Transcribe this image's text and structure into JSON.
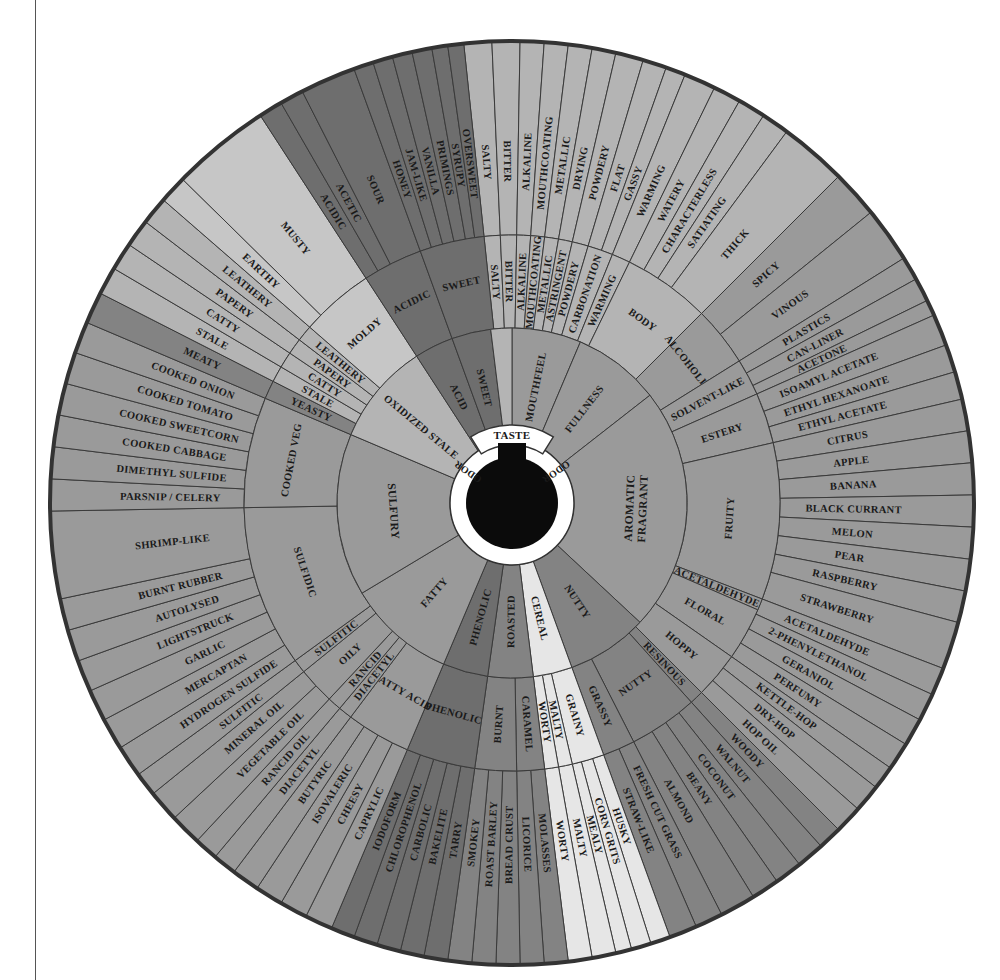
{
  "page": {
    "top_cropped_text": "",
    "background": "#ffffff"
  },
  "wheel": {
    "center": [
      512,
      503
    ],
    "radii": {
      "hub": 46,
      "hub_ring": 62,
      "inner": 175,
      "middle": 268,
      "outer": 462
    },
    "colors": {
      "dark": "#6e6e6e",
      "mid_dark": "#838383",
      "mid": "#9a9a9a",
      "light": "#b4b4b4",
      "lighter": "#c6c6c6",
      "pale": "#e6e6e6",
      "hub": "#0b0b0b",
      "hub_ring": "#ffffff",
      "rim": "#333333"
    },
    "hub_labels": {
      "taste": "TASTE",
      "odor_left": "ODOR",
      "odor_right": "ODOR"
    },
    "inner": [
      {
        "label": "MOUTHFEEL",
        "start": 0,
        "end": 23,
        "color": "mid"
      },
      {
        "label": "FULLNESS",
        "start": 23,
        "end": 52,
        "color": "mid"
      },
      {
        "label": "AROMATIC FRAGRANT",
        "start": 52,
        "end": 133,
        "color": "mid"
      },
      {
        "label": "NUTTY",
        "start": 133,
        "end": 160,
        "color": "mid_dark"
      },
      {
        "label": "CEREAL",
        "start": 160,
        "end": 173,
        "color": "pale"
      },
      {
        "label": "ROASTED",
        "start": 173,
        "end": 188,
        "color": "mid_dark"
      },
      {
        "label": "PHENOLIC",
        "start": 188,
        "end": 203,
        "color": "dark"
      },
      {
        "label": "FATTY",
        "start": 203,
        "end": 239,
        "color": "mid"
      },
      {
        "label": "SULFURY",
        "start": 239,
        "end": 293,
        "color": "mid"
      },
      {
        "label": "OXIDIZED STALE",
        "start": 293,
        "end": 327,
        "color": "light"
      },
      {
        "label": "ACID",
        "start": 327,
        "end": 340,
        "color": "dark"
      },
      {
        "label": "SWEET",
        "start": 340,
        "end": 353,
        "color": "dark"
      },
      {
        "label": "",
        "start": 353,
        "end": 360,
        "color": "light"
      }
    ],
    "middle": [
      {
        "label": "SALTY",
        "start": 354,
        "end": 357.5,
        "color": "light"
      },
      {
        "label": "BITTER",
        "start": 357.5,
        "end": 1,
        "color": "light"
      },
      {
        "label": "ALKALINE",
        "start": 1,
        "end": 4,
        "color": "light"
      },
      {
        "label": "MOUTHCOATING",
        "start": 4,
        "end": 7,
        "color": "light"
      },
      {
        "label": "METALLIC",
        "start": 7,
        "end": 10,
        "color": "light"
      },
      {
        "label": "ASTRINGENT",
        "start": 10,
        "end": 13,
        "color": "light"
      },
      {
        "label": "POWDERY",
        "start": 13,
        "end": 16.5,
        "color": "light"
      },
      {
        "label": "CARBONATION",
        "start": 16.5,
        "end": 22,
        "color": "light"
      },
      {
        "label": "WARMING",
        "start": 22,
        "end": 26,
        "color": "light"
      },
      {
        "label": "BODY",
        "start": 26,
        "end": 45,
        "color": "light"
      },
      {
        "label": "ALCOHOLIC",
        "start": 45,
        "end": 58,
        "color": "mid"
      },
      {
        "label": "SOLVENT-LIKE",
        "start": 58,
        "end": 66,
        "color": "mid"
      },
      {
        "label": "ESTERY",
        "start": 66,
        "end": 77,
        "color": "mid"
      },
      {
        "label": "FRUITY",
        "start": 77,
        "end": 111,
        "color": "mid"
      },
      {
        "label": "ACETALDEHYDE",
        "start": 111,
        "end": 113.5,
        "color": "mid"
      },
      {
        "label": "FLORAL",
        "start": 113.5,
        "end": 125,
        "color": "mid"
      },
      {
        "label": "HOPPY",
        "start": 125,
        "end": 135,
        "color": "mid"
      },
      {
        "label": "RESINOUS",
        "start": 135,
        "end": 138,
        "color": "mid_dark"
      },
      {
        "label": "NUTTY",
        "start": 138,
        "end": 153,
        "color": "mid_dark"
      },
      {
        "label": "GRASSY",
        "start": 153,
        "end": 160,
        "color": "mid_dark"
      },
      {
        "label": "GRAINY",
        "start": 160,
        "end": 167,
        "color": "pale"
      },
      {
        "label": "MALTY",
        "start": 167,
        "end": 170,
        "color": "pale"
      },
      {
        "label": "WORTY",
        "start": 170,
        "end": 173,
        "color": "pale"
      },
      {
        "label": "CARAMEL",
        "start": 173,
        "end": 179,
        "color": "mid_dark"
      },
      {
        "label": "BURNT",
        "start": 179,
        "end": 188,
        "color": "mid_dark"
      },
      {
        "label": "PHENOLIC",
        "start": 188,
        "end": 203,
        "color": "dark"
      },
      {
        "label": "FATTY ACID",
        "start": 203,
        "end": 217,
        "color": "mid"
      },
      {
        "label": "DIACETYL",
        "start": 217,
        "end": 220,
        "color": "mid"
      },
      {
        "label": "RANCID",
        "start": 220,
        "end": 223,
        "color": "mid"
      },
      {
        "label": "OILY",
        "start": 223,
        "end": 231,
        "color": "mid"
      },
      {
        "label": "SULFITIC",
        "start": 231,
        "end": 234,
        "color": "mid"
      },
      {
        "label": "SULFIDIC",
        "start": 234,
        "end": 269,
        "color": "mid"
      },
      {
        "label": "COOKED VEG",
        "start": 269,
        "end": 293,
        "color": "mid"
      },
      {
        "label": "YEASTY",
        "start": 293,
        "end": 297,
        "color": "mid_dark"
      },
      {
        "label": "STALE",
        "start": 297,
        "end": 300.5,
        "color": "light"
      },
      {
        "label": "CATTY",
        "start": 300.5,
        "end": 304,
        "color": "light"
      },
      {
        "label": "PAPERY",
        "start": 304,
        "end": 307.5,
        "color": "light"
      },
      {
        "label": "LEATHERY",
        "start": 307.5,
        "end": 311,
        "color": "light"
      },
      {
        "label": "MOLDY",
        "start": 311,
        "end": 327,
        "color": "lighter"
      },
      {
        "label": "ACIDIC",
        "start": 327,
        "end": 340,
        "color": "dark"
      },
      {
        "label": "SWEET",
        "start": 340,
        "end": 354,
        "color": "dark"
      }
    ],
    "outer": [
      {
        "label": "SALTY",
        "start": 354,
        "end": 357.5,
        "color": "light"
      },
      {
        "label": "BITTER",
        "start": 357.5,
        "end": 1,
        "color": "light"
      },
      {
        "label": "ALKALINE",
        "start": 1,
        "end": 4,
        "color": "light"
      },
      {
        "label": "MOUTHCOATING",
        "start": 4,
        "end": 7,
        "color": "light"
      },
      {
        "label": "METALLIC",
        "start": 7,
        "end": 10,
        "color": "light"
      },
      {
        "label": "DRYING",
        "start": 10,
        "end": 13,
        "color": "light"
      },
      {
        "label": "POWDERY",
        "start": 13,
        "end": 16.5,
        "color": "light"
      },
      {
        "label": "FLAT",
        "start": 16.5,
        "end": 19.5,
        "color": "light"
      },
      {
        "label": "GASSY",
        "start": 19.5,
        "end": 22,
        "color": "light"
      },
      {
        "label": "WARMING",
        "start": 22,
        "end": 26,
        "color": "light"
      },
      {
        "label": "WATERY",
        "start": 26,
        "end": 29.5,
        "color": "light"
      },
      {
        "label": "CHARACTERLESS",
        "start": 29.5,
        "end": 33,
        "color": "light"
      },
      {
        "label": "SATIATING",
        "start": 33,
        "end": 36.5,
        "color": "light"
      },
      {
        "label": "THICK",
        "start": 36.5,
        "end": 45,
        "color": "light"
      },
      {
        "label": "SPICY",
        "start": 45,
        "end": 51,
        "color": "mid"
      },
      {
        "label": "VINOUS",
        "start": 51,
        "end": 58,
        "color": "mid"
      },
      {
        "label": "PLASTICS",
        "start": 58,
        "end": 61,
        "color": "mid"
      },
      {
        "label": "CAN-LINER",
        "start": 61,
        "end": 64,
        "color": "mid"
      },
      {
        "label": "ACETONE",
        "start": 64,
        "end": 66,
        "color": "mid"
      },
      {
        "label": "ISOAMYL ACETATE",
        "start": 66,
        "end": 70,
        "color": "mid"
      },
      {
        "label": "ETHYL HEXANOATE",
        "start": 70,
        "end": 73.5,
        "color": "mid"
      },
      {
        "label": "ETHYL ACETATE",
        "start": 73.5,
        "end": 77,
        "color": "mid"
      },
      {
        "label": "CITRUS",
        "start": 77,
        "end": 81,
        "color": "mid"
      },
      {
        "label": "APPLE",
        "start": 81,
        "end": 85,
        "color": "mid"
      },
      {
        "label": "BANANA",
        "start": 85,
        "end": 89,
        "color": "mid"
      },
      {
        "label": "BLACK CURRANT",
        "start": 89,
        "end": 93,
        "color": "mid"
      },
      {
        "label": "MELON",
        "start": 93,
        "end": 97,
        "color": "mid"
      },
      {
        "label": "PEAR",
        "start": 97,
        "end": 101,
        "color": "mid"
      },
      {
        "label": "RASPBERRY",
        "start": 101,
        "end": 105,
        "color": "mid"
      },
      {
        "label": "STRAWBERRY",
        "start": 105,
        "end": 111,
        "color": "mid"
      },
      {
        "label": "ACETALDEHYDE",
        "start": 111,
        "end": 114.5,
        "color": "mid"
      },
      {
        "label": "2-PHENYLETHANOL",
        "start": 114.5,
        "end": 118,
        "color": "mid"
      },
      {
        "label": "GERANIOL",
        "start": 118,
        "end": 121.5,
        "color": "mid"
      },
      {
        "label": "PERFUMY",
        "start": 121.5,
        "end": 125,
        "color": "mid"
      },
      {
        "label": "KETTLE-HOP",
        "start": 125,
        "end": 128,
        "color": "mid"
      },
      {
        "label": "DRY-HOP",
        "start": 128,
        "end": 131.5,
        "color": "mid"
      },
      {
        "label": "HOP OIL",
        "start": 131.5,
        "end": 135,
        "color": "mid"
      },
      {
        "label": "WOODY",
        "start": 135,
        "end": 138,
        "color": "mid_dark"
      },
      {
        "label": "WALNUT",
        "start": 138,
        "end": 141.5,
        "color": "mid_dark"
      },
      {
        "label": "COCONUT",
        "start": 141.5,
        "end": 145,
        "color": "mid_dark"
      },
      {
        "label": "BEANY",
        "start": 145,
        "end": 148.5,
        "color": "mid_dark"
      },
      {
        "label": "ALMOND",
        "start": 148.5,
        "end": 153,
        "color": "mid_dark"
      },
      {
        "label": "FRESH CUT GRASS",
        "start": 153,
        "end": 156.5,
        "color": "mid_dark"
      },
      {
        "label": "STRAW-LIKE",
        "start": 156.5,
        "end": 160,
        "color": "mid_dark"
      },
      {
        "label": "HUSKY",
        "start": 160,
        "end": 162.5,
        "color": "pale"
      },
      {
        "label": "CORN GRITS",
        "start": 162.5,
        "end": 165,
        "color": "pale"
      },
      {
        "label": "MEALY",
        "start": 165,
        "end": 167,
        "color": "pale"
      },
      {
        "label": "MALTY",
        "start": 167,
        "end": 170,
        "color": "pale"
      },
      {
        "label": "WORTY",
        "start": 170,
        "end": 173,
        "color": "pale"
      },
      {
        "label": "MOLASSES",
        "start": 173,
        "end": 176,
        "color": "mid_dark"
      },
      {
        "label": "LICORICE",
        "start": 176,
        "end": 179,
        "color": "mid_dark"
      },
      {
        "label": "BREAD CRUST",
        "start": 179,
        "end": 182,
        "color": "mid_dark"
      },
      {
        "label": "ROAST BARLEY",
        "start": 182,
        "end": 185,
        "color": "mid_dark"
      },
      {
        "label": "SMOKEY",
        "start": 185,
        "end": 188,
        "color": "mid_dark"
      },
      {
        "label": "TARRY",
        "start": 188,
        "end": 191,
        "color": "dark"
      },
      {
        "label": "BAKELITE",
        "start": 191,
        "end": 194,
        "color": "dark"
      },
      {
        "label": "CARBOLIC",
        "start": 194,
        "end": 197,
        "color": "dark"
      },
      {
        "label": "CHLOROPHENOL",
        "start": 197,
        "end": 200,
        "color": "dark"
      },
      {
        "label": "IODOFORM",
        "start": 200,
        "end": 203,
        "color": "dark"
      },
      {
        "label": "CAPRYLIC",
        "start": 203,
        "end": 206.5,
        "color": "mid"
      },
      {
        "label": "CHEESY",
        "start": 206.5,
        "end": 210,
        "color": "mid"
      },
      {
        "label": "ISOVALERIC",
        "start": 210,
        "end": 213.5,
        "color": "mid"
      },
      {
        "label": "BUTYRIC",
        "start": 213.5,
        "end": 217,
        "color": "mid"
      },
      {
        "label": "DIACETYL",
        "start": 217,
        "end": 220,
        "color": "mid"
      },
      {
        "label": "RANCID OIL",
        "start": 220,
        "end": 223,
        "color": "mid"
      },
      {
        "label": "VEGETABLE OIL",
        "start": 223,
        "end": 227,
        "color": "mid"
      },
      {
        "label": "MINERAL OIL",
        "start": 227,
        "end": 231,
        "color": "mid"
      },
      {
        "label": "SULFITIC",
        "start": 231,
        "end": 234,
        "color": "mid"
      },
      {
        "label": "HYDROGEN SULFIDE",
        "start": 234,
        "end": 238,
        "color": "mid"
      },
      {
        "label": "MERCAPTAN",
        "start": 238,
        "end": 242,
        "color": "mid"
      },
      {
        "label": "GARLIC",
        "start": 242,
        "end": 246,
        "color": "mid"
      },
      {
        "label": "LIGHTSTRUCK",
        "start": 246,
        "end": 250,
        "color": "mid"
      },
      {
        "label": "AUTOLYSED",
        "start": 250,
        "end": 254,
        "color": "mid"
      },
      {
        "label": "BURNT RUBBER",
        "start": 254,
        "end": 258,
        "color": "mid"
      },
      {
        "label": "SHRIMP-LIKE",
        "start": 258,
        "end": 269,
        "color": "mid"
      },
      {
        "label": "PARSNIP / CELERY",
        "start": 269,
        "end": 273,
        "color": "mid"
      },
      {
        "label": "DIMETHYL SULFIDE",
        "start": 273,
        "end": 277,
        "color": "mid"
      },
      {
        "label": "COOKED CABBAGE",
        "start": 277,
        "end": 281,
        "color": "mid"
      },
      {
        "label": "COOKED SWEETCORN",
        "start": 281,
        "end": 285,
        "color": "mid"
      },
      {
        "label": "COOKED TOMATO",
        "start": 285,
        "end": 289,
        "color": "mid"
      },
      {
        "label": "COOKED ONION",
        "start": 289,
        "end": 293,
        "color": "mid"
      },
      {
        "label": "MEATY",
        "start": 293,
        "end": 297,
        "color": "mid_dark"
      },
      {
        "label": "STALE",
        "start": 297,
        "end": 300.5,
        "color": "light"
      },
      {
        "label": "CATTY",
        "start": 300.5,
        "end": 304,
        "color": "light"
      },
      {
        "label": "PAPERY",
        "start": 304,
        "end": 307.5,
        "color": "light"
      },
      {
        "label": "LEATHERY",
        "start": 307.5,
        "end": 311,
        "color": "light"
      },
      {
        "label": "EARTHY",
        "start": 311,
        "end": 314.5,
        "color": "lighter"
      },
      {
        "label": "MUSTY",
        "start": 314.5,
        "end": 327,
        "color": "lighter"
      },
      {
        "label": "ACIDIC",
        "start": 327,
        "end": 330,
        "color": "dark"
      },
      {
        "label": "ACETIC",
        "start": 330,
        "end": 333,
        "color": "dark"
      },
      {
        "label": "SOUR",
        "start": 333,
        "end": 340,
        "color": "dark"
      },
      {
        "label": "HONEY",
        "start": 340,
        "end": 342.5,
        "color": "dark"
      },
      {
        "label": "JAM-LIKE",
        "start": 342.5,
        "end": 345,
        "color": "dark"
      },
      {
        "label": "VANILLA",
        "start": 345,
        "end": 347.5,
        "color": "dark"
      },
      {
        "label": "PRIMINGS",
        "start": 347.5,
        "end": 350,
        "color": "dark"
      },
      {
        "label": "SYRUPY",
        "start": 350,
        "end": 352,
        "color": "dark"
      },
      {
        "label": "OVERSWEET",
        "start": 352,
        "end": 354,
        "color": "dark"
      }
    ]
  }
}
